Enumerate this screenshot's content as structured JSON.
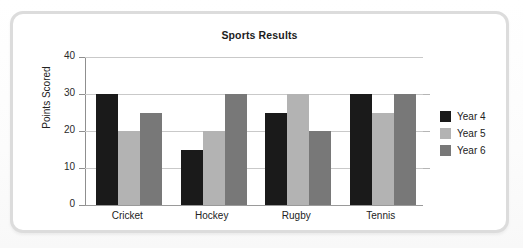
{
  "chart_data": {
    "type": "bar",
    "title": "Sports Results",
    "xlabel": "",
    "ylabel": "Points Scored",
    "categories": [
      "Cricket",
      "Hockey",
      "Rugby",
      "Tennis"
    ],
    "series": [
      {
        "name": "Year 4",
        "color": "#1a1a1a",
        "values": [
          30,
          15,
          25,
          30
        ]
      },
      {
        "name": "Year 5",
        "color": "#b3b3b3",
        "values": [
          20,
          20,
          30,
          25
        ]
      },
      {
        "name": "Year 6",
        "color": "#787878",
        "values": [
          25,
          30,
          20,
          30
        ]
      }
    ],
    "ylim": [
      0,
      40
    ],
    "yticks": [
      0,
      10,
      20,
      30,
      40
    ],
    "ytick_labels": [
      "0",
      "10",
      "20",
      "30",
      "40"
    ],
    "grid": true,
    "legend_position": "right"
  }
}
